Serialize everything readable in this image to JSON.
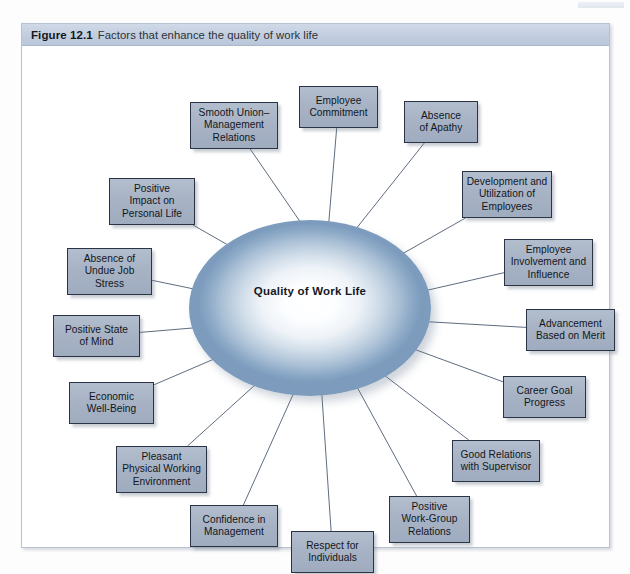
{
  "figure": {
    "label": "Figure 12.1",
    "caption": "Factors that enhance the quality of work life"
  },
  "core": {
    "label": "Quality of\nWork Life"
  },
  "colors": {
    "box_fill": "#a7b3c5",
    "box_border": "#2b3444",
    "caption_band": "#c2cddf",
    "ellipse_edge": "#7d9cbd",
    "ellipse_center": "#ffffff",
    "connector": "#5f6d80",
    "frame_border": "#b9c2d0"
  },
  "diagram": {
    "type": "radial-convergence",
    "direction": "inward",
    "center_node": "Quality of Work Life",
    "factor_count": 16,
    "factors": [
      {
        "id": "smooth-union-management-relations",
        "label": "Smooth Union–\nManagement\nRelations",
        "x": 168,
        "y": 56,
        "w": 88,
        "h": 47,
        "arrow_angle_deg": 318
      },
      {
        "id": "employee-commitment",
        "label": "Employee\nCommitment",
        "x": 277,
        "y": 40,
        "w": 79,
        "h": 42,
        "arrow_angle_deg": 272
      },
      {
        "id": "absence-of-apathy",
        "label": "Absence\nof Apathy",
        "x": 382,
        "y": 55,
        "w": 74,
        "h": 42,
        "arrow_angle_deg": 233
      },
      {
        "id": "development-and-utilization-of-employees",
        "label": "Development and\nUtilization of\nEmployees",
        "x": 440,
        "y": 125,
        "w": 90,
        "h": 47,
        "arrow_angle_deg": 217
      },
      {
        "id": "employee-involvement-and-influence",
        "label": "Employee\nInvolvement and\nInfluence",
        "x": 482,
        "y": 193,
        "w": 89,
        "h": 47,
        "arrow_angle_deg": 203
      },
      {
        "id": "advancement-based-on-merit",
        "label": "Advancement\nBased on Merit",
        "x": 504,
        "y": 263,
        "w": 89,
        "h": 42,
        "arrow_angle_deg": 180
      },
      {
        "id": "career-goal-progress",
        "label": "Career Goal\nProgress",
        "x": 481,
        "y": 330,
        "w": 83,
        "h": 42,
        "arrow_angle_deg": 155
      },
      {
        "id": "good-relations-with-supervisor",
        "label": "Good Relations\nwith Supervisor",
        "x": 430,
        "y": 394,
        "w": 88,
        "h": 42,
        "arrow_angle_deg": 138
      },
      {
        "id": "positive-work-group-relations",
        "label": "Positive\nWork-Group\nRelations",
        "x": 367,
        "y": 450,
        "w": 81,
        "h": 47,
        "arrow_angle_deg": 110
      },
      {
        "id": "respect-for-individuals",
        "label": "Respect for\nIndividuals",
        "x": 269,
        "y": 485,
        "w": 83,
        "h": 42,
        "arrow_angle_deg": 90
      },
      {
        "id": "confidence-in-management",
        "label": "Confidence in\nManagement",
        "x": 168,
        "y": 459,
        "w": 88,
        "h": 42,
        "arrow_angle_deg": 62
      },
      {
        "id": "pleasant-physical-working-environment",
        "label": "Pleasant\nPhysical Working\nEnvironment",
        "x": 94,
        "y": 400,
        "w": 91,
        "h": 47,
        "arrow_angle_deg": 40
      },
      {
        "id": "economic-well-being",
        "label": "Economic\nWell-Being",
        "x": 47,
        "y": 336,
        "w": 85,
        "h": 42,
        "arrow_angle_deg": 25
      },
      {
        "id": "positive-state-of-mind",
        "label": "Positive State\nof Mind",
        "x": 31,
        "y": 269,
        "w": 87,
        "h": 42,
        "arrow_angle_deg": 0
      },
      {
        "id": "absence-of-undue-job-stress",
        "label": "Absence of\nUndue Job\nStress",
        "x": 45,
        "y": 202,
        "w": 85,
        "h": 47,
        "arrow_angle_deg": 341
      },
      {
        "id": "positive-impact-on-personal-life",
        "label": "Positive\nImpact on\nPersonal Life",
        "x": 87,
        "y": 132,
        "w": 86,
        "h": 47,
        "arrow_angle_deg": 330
      }
    ]
  }
}
